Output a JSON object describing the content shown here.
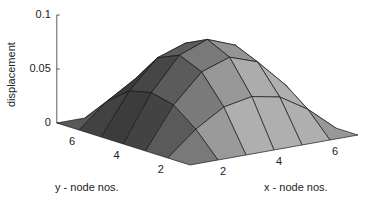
{
  "chart_data": {
    "type": "surface",
    "title": "",
    "xlabel": "x - node nos.",
    "ylabel": "y - node nos.",
    "zlabel": "displacement",
    "x": [
      1,
      2,
      3,
      4,
      5,
      6,
      7
    ],
    "y": [
      1,
      2,
      3,
      4,
      5,
      6,
      7
    ],
    "z": [
      [
        0.0,
        0.0,
        0.0,
        0.0,
        0.0,
        0.0,
        0.0
      ],
      [
        0.0,
        0.022,
        0.038,
        0.043,
        0.038,
        0.022,
        0.0
      ],
      [
        0.0,
        0.038,
        0.064,
        0.073,
        0.064,
        0.038,
        0.0
      ],
      [
        0.0,
        0.043,
        0.073,
        0.083,
        0.073,
        0.043,
        0.0
      ],
      [
        0.0,
        0.038,
        0.064,
        0.073,
        0.064,
        0.038,
        0.0
      ],
      [
        0.0,
        0.022,
        0.038,
        0.043,
        0.038,
        0.022,
        0.0
      ],
      [
        0.0,
        0.0,
        0.0,
        0.0,
        0.0,
        0.0,
        0.0
      ]
    ],
    "zlim": [
      0,
      0.1
    ],
    "z_ticks": [
      "0",
      "0.05",
      "0.1"
    ],
    "x_ticks": [
      "2",
      "4",
      "6"
    ],
    "y_ticks": [
      "2",
      "4",
      "6"
    ],
    "grid": false,
    "legend": null,
    "colormap": "gray"
  },
  "axes": {
    "z_ticks": [
      {
        "label": "0.1",
        "value": 0.1
      },
      {
        "label": "0.05",
        "value": 0.05
      },
      {
        "label": "0",
        "value": 0
      }
    ],
    "x_ticks": [
      {
        "label": "2",
        "value": 2
      },
      {
        "label": "4",
        "value": 4
      },
      {
        "label": "6",
        "value": 6
      }
    ],
    "y_ticks": [
      {
        "label": "2",
        "value": 2
      },
      {
        "label": "4",
        "value": 4
      },
      {
        "label": "6",
        "value": 6
      }
    ]
  }
}
